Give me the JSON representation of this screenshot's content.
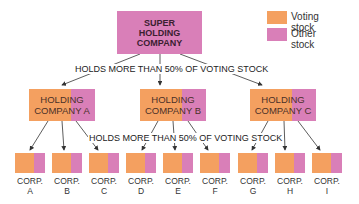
{
  "colors": {
    "voting": "#f4a060",
    "other": "#d97fb8",
    "lines": "#333333"
  },
  "legend": [
    {
      "label": "Voting stock",
      "color": "#f4a060"
    },
    {
      "label": "Other stock",
      "color": "#d97fb8"
    }
  ],
  "super_holding": {
    "label_lines": [
      "SUPER",
      "HOLDING",
      "COMPANY"
    ]
  },
  "note_top": "HOLDS MORE THAN 50% OF VOTING STOCK",
  "note_mid": "HOLDS MORE THAN 50% OF VOTING STOCK",
  "holding_companies": [
    {
      "line1": "HOLDING",
      "line2": "COMPANY A"
    },
    {
      "line1": "HOLDING",
      "line2": "COMPANY B"
    },
    {
      "line1": "HOLDING",
      "line2": "COMPANY C"
    }
  ],
  "corporations": [
    {
      "line1": "CORP.",
      "line2": "A"
    },
    {
      "line1": "CORP.",
      "line2": "B"
    },
    {
      "line1": "CORP.",
      "line2": "C"
    },
    {
      "line1": "CORP.",
      "line2": "D"
    },
    {
      "line1": "CORP.",
      "line2": "E"
    },
    {
      "line1": "CORP.",
      "line2": "F"
    },
    {
      "line1": "CORP.",
      "line2": "G"
    },
    {
      "line1": "CORP.",
      "line2": "H"
    },
    {
      "line1": "CORP.",
      "line2": "I"
    }
  ]
}
